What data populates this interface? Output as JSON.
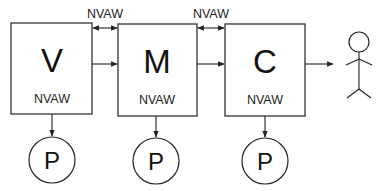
{
  "diagram": {
    "boxes": [
      {
        "id": "V",
        "letter": "V",
        "label": "NVAW"
      },
      {
        "id": "M",
        "letter": "M",
        "label": "NVAW"
      },
      {
        "id": "C",
        "letter": "C",
        "label": "NVAW"
      }
    ],
    "connectors": [
      {
        "from": "V",
        "to": "M",
        "label": "NVAW",
        "type": "bidirectional"
      },
      {
        "from": "V",
        "to": "M",
        "type": "forward"
      },
      {
        "from": "M",
        "to": "C",
        "label": "NVAW",
        "type": "bidirectional"
      },
      {
        "from": "M",
        "to": "C",
        "type": "forward"
      },
      {
        "from": "C",
        "to": "user",
        "type": "forward"
      }
    ],
    "persistence_nodes": [
      {
        "attached_to": "V",
        "label": "P"
      },
      {
        "attached_to": "M",
        "label": "P"
      },
      {
        "attached_to": "C",
        "label": "P"
      }
    ],
    "actor": {
      "name": "user",
      "icon": "stick-figure-icon"
    },
    "colors": {
      "stroke": "#222222",
      "background": "#ffffff"
    }
  }
}
